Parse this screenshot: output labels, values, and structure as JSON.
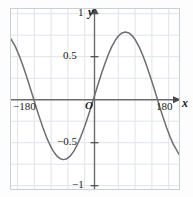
{
  "figure": {
    "background": "#ffffff",
    "plot_border_color": "#c9cfd6",
    "grid_color": "#dfe4ea",
    "axis_color": "#6b6b6b",
    "curve_color": "#6e6e6e"
  },
  "labels": {
    "y_axis": "y",
    "x_axis": "x",
    "origin": "O",
    "y_tick_1": "1",
    "y_tick_05": "0.5",
    "y_tick_neg05": "−0.5",
    "y_tick_neg1": "−1",
    "x_tick_neg180": "−180",
    "x_tick_180": "180"
  },
  "chart_data": {
    "type": "line",
    "title": "",
    "xlabel": "x",
    "ylabel": "y",
    "function": "y = sin x",
    "x_units": "degrees",
    "xlim": [
      -243,
      246
    ],
    "ylim": [
      -1.46,
      1.36
    ],
    "grid": true,
    "grid_x_step": 60,
    "grid_y_step": 0.25,
    "legend": "none",
    "x_ticks": [
      -180,
      180
    ],
    "x_tick_labels": [
      "−180",
      "180"
    ],
    "y_ticks": [
      -1,
      -0.5,
      0.5,
      1
    ],
    "y_tick_labels": [
      "−1",
      "−0.5",
      "0.5",
      "1"
    ],
    "series": [
      {
        "name": "y = sin x",
        "color": "#6e6e6e",
        "x": [
          -243,
          -230,
          -220,
          -210,
          -200,
          -190,
          -180,
          -170,
          -160,
          -150,
          -140,
          -130,
          -120,
          -110,
          -100,
          -90,
          -80,
          -70,
          -60,
          -50,
          -40,
          -30,
          -20,
          -10,
          0,
          10,
          20,
          30,
          40,
          50,
          60,
          70,
          80,
          90,
          100,
          110,
          120,
          130,
          140,
          150,
          160,
          170,
          180,
          190,
          200,
          210,
          220,
          230,
          246
        ],
        "y": [
          0.891,
          0.766,
          0.643,
          0.5,
          0.342,
          0.174,
          0.0,
          -0.174,
          -0.342,
          -0.5,
          -0.643,
          -0.766,
          -0.866,
          -0.94,
          -0.985,
          -1.0,
          -0.985,
          -0.94,
          -0.866,
          -0.766,
          -0.643,
          -0.5,
          -0.342,
          -0.174,
          0.0,
          0.174,
          0.342,
          0.5,
          0.643,
          0.766,
          0.866,
          0.94,
          0.985,
          1.0,
          0.985,
          0.94,
          0.866,
          0.766,
          0.643,
          0.5,
          0.342,
          0.174,
          0.0,
          -0.174,
          -0.342,
          -0.5,
          -0.643,
          -0.766,
          -0.914
        ]
      }
    ],
    "key_points": {
      "maximum": {
        "x": 90,
        "y": 1
      },
      "minimum": {
        "x": -90,
        "y": -1
      },
      "zero_crossings": [
        -180,
        0,
        180
      ]
    }
  }
}
